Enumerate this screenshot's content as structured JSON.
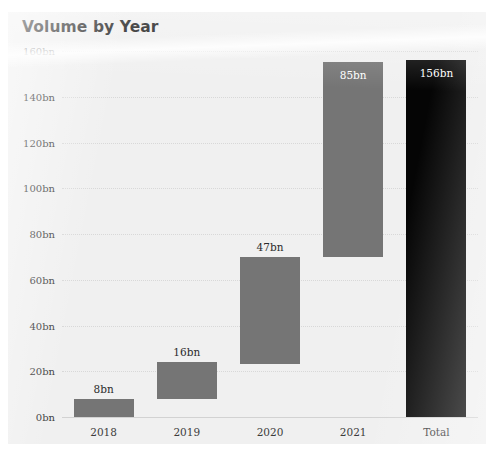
{
  "card": {
    "title": "Volume by Year",
    "background_color": "#f0f0f0"
  },
  "chart_data": {
    "type": "bar",
    "subtype": "waterfall",
    "title": "Volume by Year",
    "xlabel": "",
    "ylabel": "",
    "ylim": [
      0,
      160
    ],
    "grid": true,
    "legend": false,
    "unit_suffix": "bn",
    "categories": [
      "2018",
      "2019",
      "2020",
      "2021",
      "Total"
    ],
    "values": [
      8,
      16,
      47,
      85,
      156
    ],
    "data_labels": [
      "8bn",
      "16bn",
      "47bn",
      "85bn",
      "156bn"
    ],
    "bars": [
      {
        "category": "2018",
        "label": "8bn",
        "delta": 8,
        "start": 0,
        "end": 8,
        "kind": "step",
        "color": "#757575",
        "label_color": "#2b2b2b",
        "label_position": "outside"
      },
      {
        "category": "2019",
        "label": "16bn",
        "delta": 16,
        "start": 8,
        "end": 24,
        "kind": "step",
        "color": "#757575",
        "label_color": "#2b2b2b",
        "label_position": "outside"
      },
      {
        "category": "2020",
        "label": "47bn",
        "delta": 47,
        "start": 23,
        "end": 70,
        "kind": "step",
        "color": "#757575",
        "label_color": "#2b2b2b",
        "label_position": "outside"
      },
      {
        "category": "2021",
        "label": "85bn",
        "delta": 85,
        "start": 70,
        "end": 155,
        "kind": "step",
        "color": "#757575",
        "label_color": "#ffffff",
        "label_position": "inside"
      },
      {
        "category": "Total",
        "label": "156bn",
        "delta": 156,
        "start": 0,
        "end": 156,
        "kind": "total",
        "color": "#050505",
        "label_color": "#ffffff",
        "label_position": "inside"
      }
    ],
    "y_ticks": [
      {
        "value": 0,
        "label": "0bn"
      },
      {
        "value": 20,
        "label": "20bn"
      },
      {
        "value": 40,
        "label": "40bn"
      },
      {
        "value": 60,
        "label": "60bn"
      },
      {
        "value": 80,
        "label": "80bn"
      },
      {
        "value": 100,
        "label": "100bn"
      },
      {
        "value": 120,
        "label": "120bn"
      },
      {
        "value": 140,
        "label": "140bn"
      },
      {
        "value": 160,
        "label": "160bn"
      }
    ],
    "x_ticks": [
      "2018",
      "2019",
      "2020",
      "2021",
      "Total"
    ],
    "colors": {
      "step_bar": "#757575",
      "total_bar": "#050505",
      "background": "#f0f0f0",
      "gridline": "#d8d8d8",
      "axis_text": "#3c3c3c",
      "title_text": "#1d1d1d"
    }
  }
}
